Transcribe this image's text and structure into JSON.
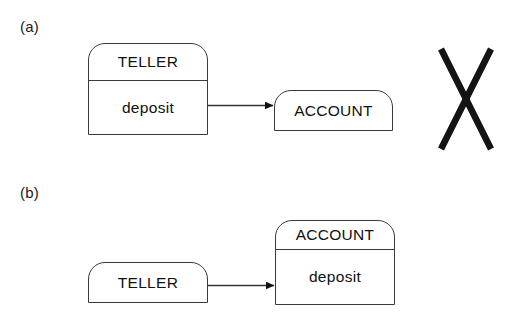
{
  "figure": {
    "background_color": "#ffffff",
    "stroke_color": "#3a3a3a",
    "text_color": "#101010",
    "cross_color": "#141414"
  },
  "panels": [
    {
      "id": "a",
      "label": "(a)",
      "sender": {
        "class_name": "TELLER",
        "operation": "deposit",
        "compartments": 2
      },
      "receiver": {
        "class_name": "ACCOUNT",
        "operation": "",
        "compartments": 1
      },
      "message": {
        "arrow_direction": "right",
        "label": ""
      },
      "annotation": {
        "mark": "cross",
        "meaning": "incorrect"
      }
    },
    {
      "id": "b",
      "label": "(b)",
      "sender": {
        "class_name": "TELLER",
        "operation": "",
        "compartments": 1
      },
      "receiver": {
        "class_name": "ACCOUNT",
        "operation": "deposit",
        "compartments": 2
      },
      "message": {
        "arrow_direction": "right",
        "label": ""
      },
      "annotation": {
        "mark": "",
        "meaning": "correct"
      }
    }
  ]
}
